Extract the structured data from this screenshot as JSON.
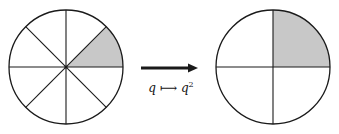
{
  "diagram": {
    "left_circle": {
      "sectors": 8,
      "shaded_sector": "0 to 45 degrees (first octant, upper right)"
    },
    "right_circle": {
      "sectors": 4,
      "shaded_sector": "0 to 90 degrees (first quadrant, upper right)"
    },
    "arrow": {
      "direction": "right"
    },
    "map_label": {
      "var": "q",
      "arrow": "⟼",
      "result": "q",
      "exponent": "2"
    },
    "colors": {
      "stroke": "#1a1a1a",
      "shade": "#c8c8c8",
      "background": "#ffffff"
    }
  }
}
